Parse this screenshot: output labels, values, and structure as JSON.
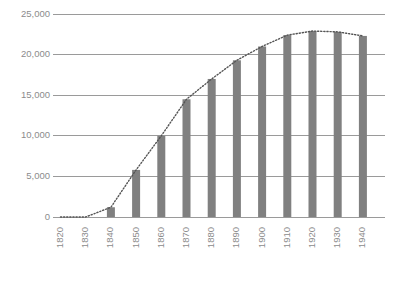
{
  "chart_data": {
    "type": "bar",
    "title": "",
    "subtitle": "",
    "xlabel": "",
    "ylabel": "",
    "categories": [
      "1820",
      "1830",
      "1840",
      "1850",
      "1860",
      "1870",
      "1880",
      "1890",
      "1900",
      "1910",
      "1920",
      "1930",
      "1940"
    ],
    "values": [
      0,
      0,
      1200,
      5800,
      10000,
      14500,
      17000,
      19300,
      21000,
      22400,
      22900,
      22800,
      22300
    ],
    "series": [
      {
        "name": "bars",
        "type": "bar",
        "values": [
          0,
          0,
          1200,
          5800,
          10000,
          14500,
          17000,
          19300,
          21000,
          22400,
          22900,
          22800,
          22300
        ]
      },
      {
        "name": "trend",
        "type": "line",
        "style": "dotted",
        "values": [
          0,
          0,
          1200,
          5800,
          10000,
          14500,
          17000,
          19300,
          21000,
          22400,
          22900,
          22800,
          22300
        ]
      }
    ],
    "ylim": [
      0,
      25000
    ],
    "yticks": [
      0,
      5000,
      10000,
      15000,
      20000,
      25000
    ],
    "ytick_labels": [
      "0",
      "5,000",
      "10,000",
      "15,000",
      "20,000",
      "25,000"
    ],
    "xtick_labels": [
      "1820",
      "1830",
      "1840",
      "1850",
      "1860",
      "1870",
      "1880",
      "1890",
      "1900",
      "1910",
      "1920",
      "1930",
      "1940"
    ],
    "grid": true,
    "legend": false,
    "legend_position": "none",
    "colors": {
      "bar": "#808080",
      "gridline": "#9a9a9a",
      "trendline": "#555555",
      "tick_label": "#8c8c8c",
      "background": "#ffffff"
    },
    "xlabel_rotation": -90,
    "annotations": []
  }
}
